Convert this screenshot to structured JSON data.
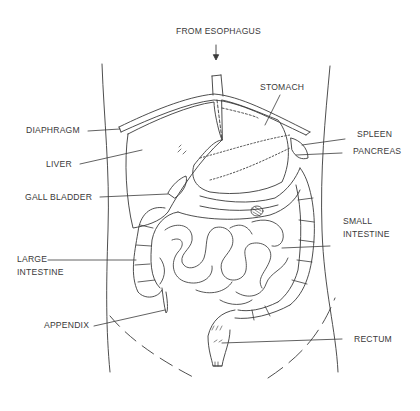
{
  "diagram": {
    "type": "anatomical-diagram",
    "line_color": "#3a3a3a",
    "background": "#ffffff",
    "labels": {
      "from_esophagus": "FROM ESOPHAGUS",
      "stomach": "STOMACH",
      "diaphragm": "DIAPHRAGM",
      "spleen": "SPLEEN",
      "pancreas": "PANCREAS",
      "liver": "LIVER",
      "gall_bladder": "GALL BLADDER",
      "small_intestine_line1": "SMALL",
      "small_intestine_line2": "INTESTINE",
      "large_intestine_line1": "LARGE",
      "large_intestine_line2": "INTESTINE",
      "appendix": "APPENDIX",
      "rectum": "RECTUM"
    }
  }
}
